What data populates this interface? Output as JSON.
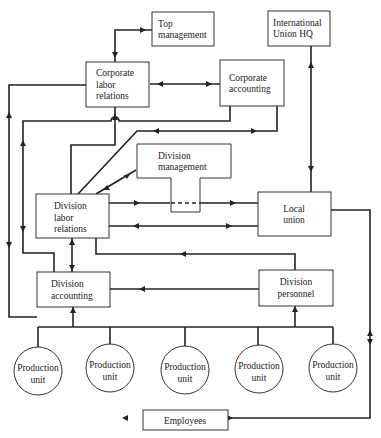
{
  "diagram": {
    "type": "organizational-flow",
    "nodes": {
      "top_management": {
        "line1": "Top",
        "line2": "management"
      },
      "international_union_hq": {
        "line1": "International",
        "line2": "Union HQ"
      },
      "corporate_labor_relations": {
        "line1": "Corporate",
        "line2": "labor",
        "line3": "relations"
      },
      "corporate_accounting": {
        "line1": "Corporate",
        "line2": "accounting"
      },
      "division_management": {
        "line1": "Division",
        "line2": "management"
      },
      "division_labor_relations": {
        "line1": "Division",
        "line2": "labor",
        "line3": "relations"
      },
      "local_union": {
        "line1": "Local",
        "line2": "union"
      },
      "division_accounting": {
        "line1": "Division",
        "line2": "accounting"
      },
      "division_personnel": {
        "line1": "Division",
        "line2": "personnel"
      },
      "production_units": [
        {
          "line1": "Production",
          "line2": "unit"
        },
        {
          "line1": "Production",
          "line2": "unit"
        },
        {
          "line1": "Production",
          "line2": "unit"
        },
        {
          "line1": "Production",
          "line2": "unit"
        },
        {
          "line1": "Production",
          "line2": "unit"
        }
      ],
      "employees": {
        "label": "Employees"
      }
    },
    "edges": [
      {
        "from": "Corporate labor relations",
        "to": "Top management",
        "direction": "both"
      },
      {
        "from": "Corporate labor relations",
        "to": "Corporate accounting",
        "direction": "both"
      },
      {
        "from": "International Union HQ",
        "to": "Local union",
        "direction": "both"
      },
      {
        "from": "Corporate accounting",
        "to": "Division accounting",
        "direction": "forward"
      },
      {
        "from": "Corporate accounting",
        "to": "Division labor relations",
        "direction": "both"
      },
      {
        "from": "Division labor relations",
        "to": "Corporate labor relations",
        "direction": "forward"
      },
      {
        "from": "Division labor relations",
        "to": "Division management",
        "direction": "both"
      },
      {
        "from": "Division labor relations",
        "to": "Local union",
        "direction": "forward",
        "via": "Division management (dashed)"
      },
      {
        "from": "Local union",
        "to": "Division labor relations",
        "direction": "forward"
      },
      {
        "from": "Division labor relations",
        "to": "Division accounting",
        "direction": "both"
      },
      {
        "from": "Division personnel",
        "to": "Division labor relations",
        "direction": "forward"
      },
      {
        "from": "Division personnel",
        "to": "Division accounting",
        "direction": "forward"
      },
      {
        "from": "Corporate labor relations",
        "to": "Division accounting",
        "direction": "forward"
      },
      {
        "from": "Division accounting",
        "to": "Corporate labor relations",
        "direction": "forward"
      },
      {
        "from": "Production units",
        "to": "Division accounting",
        "direction": "forward"
      },
      {
        "from": "Production units",
        "to": "Division personnel",
        "direction": "forward"
      },
      {
        "from": "Local union",
        "to": "Employees",
        "direction": "both"
      }
    ]
  }
}
